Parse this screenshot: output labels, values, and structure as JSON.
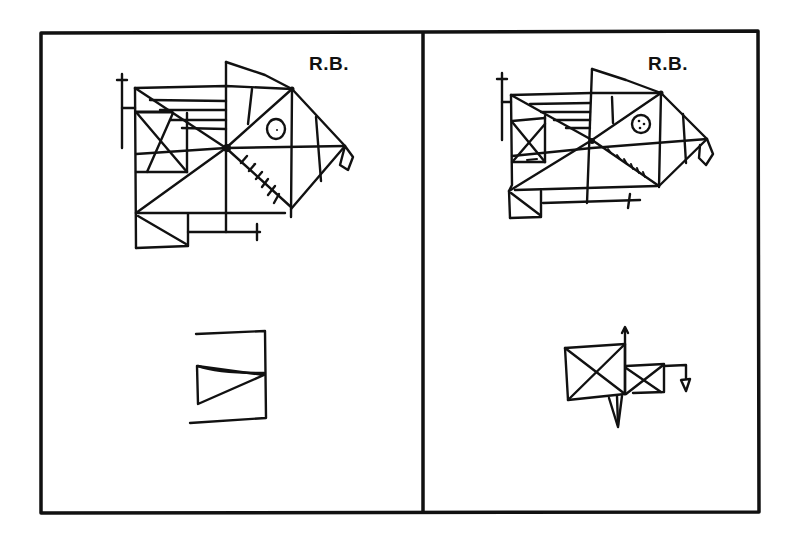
{
  "figure": {
    "panels": [
      {
        "id": "left",
        "label": "R.B.",
        "top_drawing": "complex-figure-copy",
        "bottom_drawing": "incomplete-recall-fragment"
      },
      {
        "id": "right",
        "label": "R.B.",
        "top_drawing": "complex-figure-copy",
        "bottom_drawing": "incomplete-recall-fragment"
      }
    ],
    "colors": {
      "ink": "#111111",
      "background": "#ffffff"
    }
  }
}
